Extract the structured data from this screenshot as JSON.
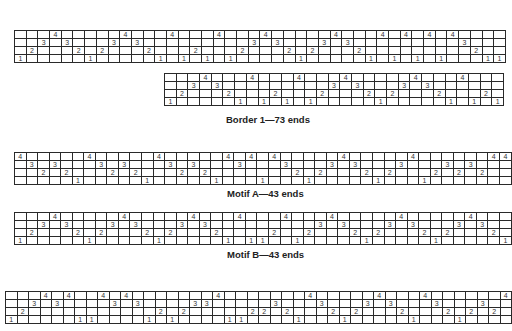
{
  "drafts": [
    {
      "id": "draft-1",
      "left": 14,
      "top": 30,
      "cell_w": 11.7,
      "threading": [
        1,
        2,
        3,
        4,
        3,
        2,
        1,
        2,
        3,
        4,
        3,
        2,
        1,
        4,
        1,
        2,
        1,
        4,
        1,
        2,
        3,
        4,
        3,
        2,
        1,
        2,
        3,
        4,
        3,
        2,
        1,
        4,
        1,
        4,
        1,
        4,
        1,
        4,
        3,
        2,
        1,
        1
      ],
      "caption": ""
    },
    {
      "id": "draft-2",
      "left": 164,
      "top": 73,
      "cell_w": 11.7,
      "threading": [
        1,
        2,
        3,
        4,
        3,
        2,
        1,
        4,
        1,
        2,
        1,
        4,
        1,
        2,
        3,
        4,
        3,
        2,
        1,
        2,
        3,
        4,
        3,
        2,
        1,
        4,
        1,
        2,
        1
      ],
      "caption": "Border 1—73 ends",
      "caption_pos": {
        "left": 226,
        "top": 114
      }
    },
    {
      "id": "draft-3",
      "left": 14,
      "top": 152,
      "cell_w": 11.7,
      "threading": [
        4,
        3,
        2,
        3,
        2,
        1,
        4,
        3,
        2,
        3,
        2,
        1,
        4,
        3,
        2,
        3,
        2,
        1,
        4,
        3,
        4,
        1,
        4,
        3,
        2,
        1,
        2,
        3,
        4,
        3,
        2,
        1,
        2,
        3,
        4,
        1,
        2,
        3,
        2,
        3,
        2,
        4,
        4
      ],
      "caption": "Motif A—43 ends",
      "caption_pos": {
        "left": 227,
        "top": 188
      }
    },
    {
      "id": "draft-4",
      "left": 14,
      "top": 212,
      "cell_w": 11.7,
      "threading": [
        1,
        2,
        3,
        4,
        3,
        2,
        1,
        2,
        3,
        4,
        3,
        2,
        1,
        2,
        3,
        4,
        3,
        2,
        1,
        4,
        1,
        1,
        2,
        4,
        1,
        2,
        3,
        4,
        3,
        2,
        1,
        2,
        3,
        4,
        3,
        2,
        1,
        2,
        3,
        4,
        3,
        2,
        1
      ],
      "caption": "Motif B—43 ends",
      "caption_pos": {
        "left": 227,
        "top": 249
      }
    },
    {
      "id": "draft-5",
      "left": 5,
      "top": 291,
      "cell_w": 11.5,
      "threading": [
        1,
        2,
        3,
        4,
        3,
        4,
        1,
        1,
        4,
        3,
        4,
        3,
        1,
        2,
        1,
        2,
        3,
        3,
        4,
        1,
        1,
        2,
        2,
        3,
        2,
        1,
        4,
        3,
        2,
        1,
        2,
        3,
        4,
        3,
        2,
        1,
        4,
        3,
        2,
        1,
        2,
        3,
        2,
        4
      ],
      "caption": ""
    }
  ]
}
